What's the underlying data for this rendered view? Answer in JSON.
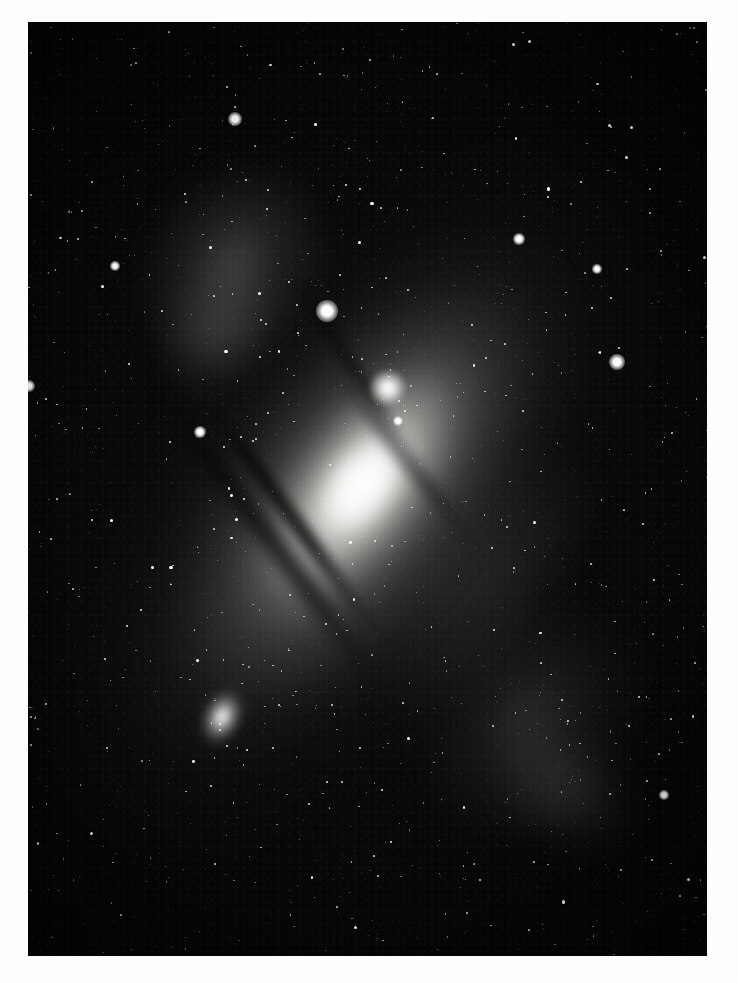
{
  "plate": {
    "title": "Andromeda Galaxy photographic plate",
    "subject": "Great Spiral Galaxy in Andromeda (M31, NGC 224)",
    "medium": "monochrome astronomical photograph",
    "orientation": "portrait",
    "margin_color": "#fdfdfb",
    "sky_color": "#060606",
    "star_color": "#ffffff",
    "caption": ""
  },
  "frame": {
    "x": 28,
    "y": 22,
    "width": 679,
    "height": 934
  },
  "objects": [
    {
      "name": "M31",
      "label": "Andromeda Galaxy core and disk",
      "type": "spiral-galaxy",
      "center_x": 372,
      "center_y": 540,
      "position_angle_deg": 37,
      "brightness": "very bright",
      "features": "bright elongated nucleus, inclined disk, dark dust lanes on southwest edge"
    },
    {
      "name": "M32",
      "label": "Satellite elliptical galaxy M32",
      "type": "elliptical-galaxy",
      "center_x": 360,
      "center_y": 366,
      "brightness": "bright",
      "features": "compact round bright knot north of nucleus"
    },
    {
      "name": "M110",
      "label": "Satellite elliptical galaxy M110 (NGC 205)",
      "type": "elliptical-galaxy",
      "center_x": 194,
      "center_y": 695,
      "position_angle_deg": 24,
      "brightness": "moderate",
      "features": "diffuse oval glow southwest of the main galaxy"
    }
  ],
  "bright_stars": [
    {
      "name": "field-star-a",
      "x": 327,
      "y": 311,
      "size": 11
    },
    {
      "name": "field-star-b",
      "x": 617,
      "y": 362,
      "size": 8
    },
    {
      "name": "field-star-c",
      "x": 235,
      "y": 119,
      "size": 7
    },
    {
      "name": "field-star-d",
      "x": 519,
      "y": 239,
      "size": 6
    },
    {
      "name": "field-star-e",
      "x": 597,
      "y": 269,
      "size": 5
    },
    {
      "name": "field-star-f",
      "x": 29,
      "y": 386,
      "size": 6
    },
    {
      "name": "field-star-g",
      "x": 200,
      "y": 432,
      "size": 6
    },
    {
      "name": "field-star-h",
      "x": 398,
      "y": 421,
      "size": 5
    },
    {
      "name": "field-star-i",
      "x": 664,
      "y": 795,
      "size": 5
    },
    {
      "name": "field-star-j",
      "x": 115,
      "y": 266,
      "size": 5
    }
  ],
  "dust_lanes": {
    "count": 4,
    "description": "dark absorption bands crossing the southwest flank of the disk",
    "color": "#040404"
  },
  "spiral_arms": {
    "count": 5,
    "description": "faint mottled outer arm segments northwest and southeast of the nucleus"
  },
  "starfield": {
    "description": "dense field of faint foreground stars across the entire plate",
    "approximate_count": 1400
  }
}
